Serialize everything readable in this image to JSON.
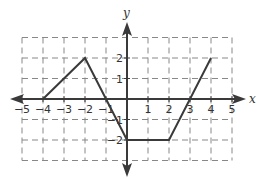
{
  "chart_data": {
    "type": "line",
    "title": "",
    "xlabel": "x",
    "ylabel": "y",
    "xlim": [
      -5,
      5
    ],
    "ylim": [
      -3,
      3
    ],
    "grid": true,
    "grid_style": "dashed",
    "x_ticks": [
      -5,
      -4,
      -3,
      -2,
      -1,
      1,
      2,
      3,
      4,
      5
    ],
    "x_tick_labels": [
      "−5",
      "−4",
      "−3",
      "−2",
      "−1",
      "1",
      "2",
      "3",
      "4",
      "5"
    ],
    "y_ticks": [
      2,
      1,
      -1,
      -2
    ],
    "y_tick_labels": [
      "2",
      "1",
      "−1",
      "−2"
    ],
    "series": [
      {
        "name": "piecewise linear graph",
        "x": [
          -4,
          -2,
          0,
          2,
          4
        ],
        "y": [
          0,
          2,
          -2,
          -2,
          2
        ]
      }
    ],
    "colors": {
      "line": "#3a3a3a",
      "axis": "#3a3a3a",
      "grid": "#888888"
    }
  }
}
